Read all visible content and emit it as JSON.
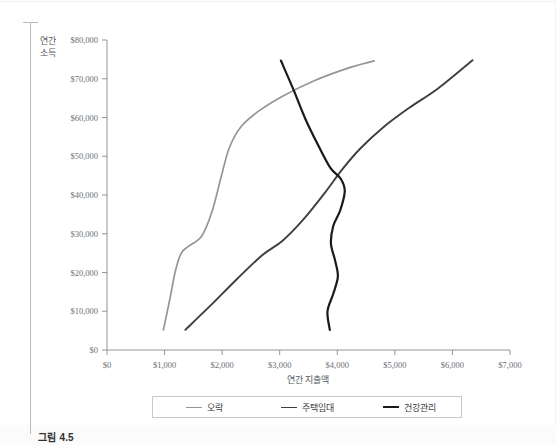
{
  "figure": {
    "caption": "그림 4.5"
  },
  "axes": {
    "y_title_line1": "연간",
    "y_title_line2": "소득",
    "x_title": "연간 지출액",
    "y_ticks": [
      "$0",
      "$10,000",
      "$20,000",
      "$30,000",
      "$40,000",
      "$50,000",
      "$60,000",
      "$70,000",
      "$80,000"
    ],
    "x_ticks": [
      "$0",
      "$1,000",
      "$2,000",
      "$3,000",
      "$4,000",
      "$5,000",
      "$6,000",
      "$7,000"
    ]
  },
  "legend": {
    "items": [
      {
        "label": "오락",
        "color": "#939598"
      },
      {
        "label": "주택임대",
        "color": "#3f3f42"
      },
      {
        "label": "건강관리",
        "color": "#1a1a1a"
      }
    ]
  },
  "chart_data": {
    "type": "line",
    "title": "그림 4.5",
    "xlabel": "연간 지출액",
    "ylabel": "연간 소득",
    "xlim": [
      0,
      7000
    ],
    "ylim": [
      0,
      80000
    ],
    "grid": false,
    "legend_position": "bottom",
    "x_tick_values": [
      0,
      1000,
      2000,
      3000,
      4000,
      5000,
      6000,
      7000
    ],
    "y_tick_values": [
      0,
      10000,
      20000,
      30000,
      40000,
      50000,
      60000,
      70000,
      80000
    ],
    "series": [
      {
        "name": "오락",
        "color": "#939598",
        "points": [
          [
            980,
            5200
          ],
          [
            1090,
            13000
          ],
          [
            1190,
            20500
          ],
          [
            1290,
            25000
          ],
          [
            1420,
            26800
          ],
          [
            1650,
            29500
          ],
          [
            1830,
            36000
          ],
          [
            1980,
            44500
          ],
          [
            2120,
            52000
          ],
          [
            2320,
            57500
          ],
          [
            2620,
            61500
          ],
          [
            3050,
            65500
          ],
          [
            3600,
            69500
          ],
          [
            4200,
            72800
          ],
          [
            4640,
            74600
          ]
        ]
      },
      {
        "name": "주택임대",
        "color": "#3f3f42",
        "points": [
          [
            1360,
            5200
          ],
          [
            1800,
            11500
          ],
          [
            2250,
            18200
          ],
          [
            2700,
            24500
          ],
          [
            3050,
            28200
          ],
          [
            3400,
            33500
          ],
          [
            3780,
            40500
          ],
          [
            4080,
            46500
          ],
          [
            4400,
            52000
          ],
          [
            4800,
            57500
          ],
          [
            5250,
            62500
          ],
          [
            5750,
            67500
          ],
          [
            6350,
            74800
          ]
        ]
      },
      {
        "name": "건강관리",
        "color": "#1a1a1a",
        "points": [
          [
            3020,
            74700
          ],
          [
            3230,
            67500
          ],
          [
            3450,
            59500
          ],
          [
            3680,
            52500
          ],
          [
            3880,
            47000
          ],
          [
            4060,
            44200
          ],
          [
            4130,
            41000
          ],
          [
            4050,
            36000
          ],
          [
            3930,
            32000
          ],
          [
            3890,
            27500
          ],
          [
            3960,
            23200
          ],
          [
            4010,
            19000
          ],
          [
            3930,
            14500
          ],
          [
            3830,
            10000
          ],
          [
            3870,
            5200
          ]
        ]
      }
    ]
  }
}
